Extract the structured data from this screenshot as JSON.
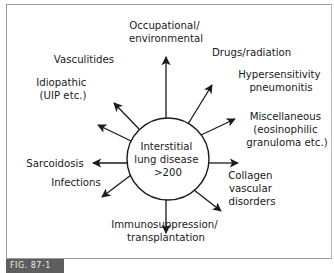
{
  "diagram": {
    "center": {
      "lines": [
        "Interstitial",
        "lung disease",
        ">200"
      ]
    },
    "categories": [
      {
        "id": "occupational",
        "lines": [
          "Occupational/",
          "environmental"
        ]
      },
      {
        "id": "drugs",
        "lines": [
          "Drugs/radiation"
        ]
      },
      {
        "id": "hypersensitivity",
        "lines": [
          "Hypersensitivity",
          "pneumonitis"
        ]
      },
      {
        "id": "miscellaneous",
        "lines": [
          "Miscellaneous",
          "(eosinophilic",
          "granuloma etc.)"
        ]
      },
      {
        "id": "collagen",
        "lines": [
          "Collagen",
          "vascular",
          "disorders"
        ]
      },
      {
        "id": "immunosuppression",
        "lines": [
          "Immunosuppression/",
          "transplantation"
        ]
      },
      {
        "id": "infections",
        "lines": [
          "Infections"
        ]
      },
      {
        "id": "sarcoidosis",
        "lines": [
          "Sarcoidosis"
        ]
      },
      {
        "id": "idiopathic",
        "lines": [
          "Idiopathic",
          "(UIP etc.)"
        ]
      },
      {
        "id": "vasculitides",
        "lines": [
          "Vasculitides"
        ]
      }
    ],
    "colors": {
      "ink": "#1a1a1a",
      "frame": "#9a9a9a",
      "caption_bg": "#5e5e5e",
      "caption_text": "#e8e8e8"
    }
  },
  "caption": {
    "label": "FIG. 87-1"
  }
}
